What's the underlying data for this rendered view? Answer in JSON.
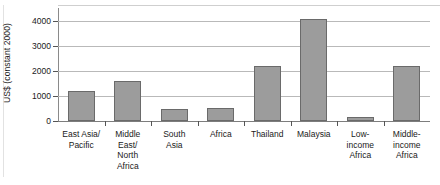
{
  "chart_data": {
    "type": "bar",
    "title": "",
    "xlabel": "",
    "ylabel": "US$ (constant 2000)",
    "ylim": [
      0,
      4200
    ],
    "yticks": [
      0,
      1000,
      2000,
      3000,
      4000
    ],
    "ytick_labels": [
      "0",
      "1000",
      "2000",
      "3000",
      "4000"
    ],
    "grid": true,
    "legend": null,
    "categories": [
      "East Asia/ Pacific",
      "Middle East/ North Africa",
      "South Asia",
      "Africa",
      "Thailand",
      "Malaysia",
      "Low- income Africa",
      "Middle- income Africa"
    ],
    "category_lines": [
      [
        "East Asia/",
        "Pacific"
      ],
      [
        "Middle",
        "East/",
        "North",
        "Africa"
      ],
      [
        "South",
        "Asia"
      ],
      [
        "Africa"
      ],
      [
        "Thailand"
      ],
      [
        "Malaysia"
      ],
      [
        "Low-",
        "income",
        "Africa"
      ],
      [
        "Middle-",
        "income",
        "Africa"
      ]
    ],
    "values": [
      1190,
      1620,
      500,
      510,
      2190,
      4080,
      180,
      2210
    ],
    "bar_color": "#9c9c9c",
    "bar_edge_color": "#6a6a6a",
    "gridline_color": "#b9b9b9",
    "axis_color": "#555555",
    "text_color": "#1a1a1a"
  }
}
